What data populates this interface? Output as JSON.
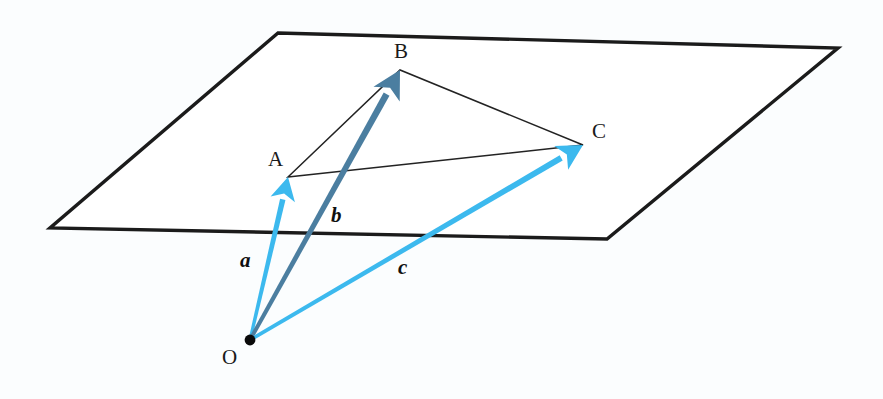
{
  "figure": {
    "canvas": {
      "width": 883,
      "height": 399
    },
    "background_color": "#fbfdfe"
  },
  "colors": {
    "plane_edge": "#1b1b1b",
    "triangle_edge": "#232323",
    "vector_a": "#3cb9ee",
    "vector_b": "#4b7ea0",
    "vector_c": "#3cb9ee",
    "origin_dot": "#0a0a0a",
    "label_text": "#1a1a1a"
  },
  "plane": {
    "name": "plane",
    "corners": [
      {
        "name": "top-left",
        "x": 278,
        "y": 33
      },
      {
        "name": "top-right",
        "x": 838,
        "y": 48
      },
      {
        "name": "bottom-right",
        "x": 607,
        "y": 239
      },
      {
        "name": "bottom-left",
        "x": 50,
        "y": 228
      }
    ],
    "stroke_width": 3.4
  },
  "points": [
    {
      "id": "O",
      "label": "O",
      "x": 250,
      "y": 340,
      "label_x": 222,
      "label_y": 345,
      "dot": true
    },
    {
      "id": "A",
      "label": "A",
      "x": 288,
      "y": 177,
      "label_x": 268,
      "label_y": 147,
      "dot": false
    },
    {
      "id": "B",
      "label": "B",
      "x": 400,
      "y": 70,
      "label_x": 394,
      "label_y": 39,
      "dot": false
    },
    {
      "id": "C",
      "label": "C",
      "x": 583,
      "y": 145,
      "label_x": 592,
      "label_y": 119,
      "dot": false
    }
  ],
  "triangle": {
    "name": "triangle-ABC",
    "vertices": [
      "A",
      "B",
      "C"
    ],
    "edges": [
      {
        "from": "A",
        "to": "B"
      },
      {
        "from": "B",
        "to": "C"
      },
      {
        "from": "C",
        "to": "A"
      }
    ],
    "stroke_width": 1.5
  },
  "vectors": [
    {
      "id": "a",
      "label": "a",
      "from": "O",
      "to": "A",
      "x1": 250,
      "y1": 340,
      "x2": 288,
      "y2": 177,
      "color": "#3cb9ee",
      "stroke_width": 5,
      "label_x": 240,
      "label_y": 248
    },
    {
      "id": "b",
      "label": "b",
      "from": "O",
      "to": "B",
      "x1": 250,
      "y1": 340,
      "x2": 400,
      "y2": 70,
      "color": "#4b7ea0",
      "stroke_width": 6,
      "label_x": 331,
      "label_y": 203
    },
    {
      "id": "c",
      "label": "c",
      "from": "O",
      "to": "C",
      "x1": 250,
      "y1": 340,
      "x2": 583,
      "y2": 145,
      "color": "#3cb9ee",
      "stroke_width": 5.5,
      "label_x": 398,
      "label_y": 255
    }
  ]
}
